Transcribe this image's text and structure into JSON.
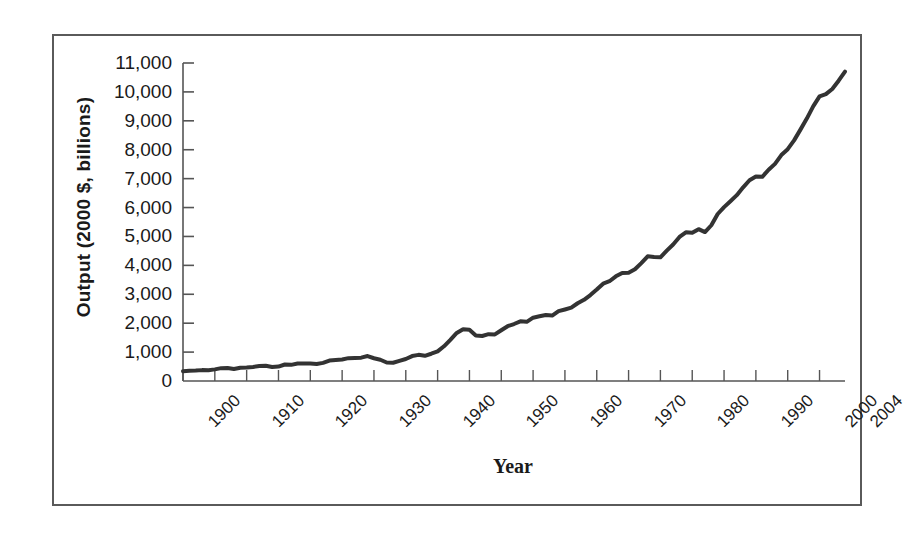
{
  "chart_data": {
    "type": "line",
    "title": "",
    "xlabel": "Year",
    "ylabel": "Output (2000 $, billions)",
    "xlim": [
      1900,
      2004
    ],
    "ylim": [
      0,
      11000
    ],
    "grid": false,
    "legend": "none",
    "line_color": "#333333",
    "line_width_px": 4,
    "y_tick_labels": [
      "11,000",
      "10,000",
      "9,000",
      "8,000",
      "7,000",
      "6,000",
      "5,000",
      "4,000",
      "3,000",
      "2,000",
      "1,000",
      "0"
    ],
    "y_tick_values": [
      11000,
      10000,
      9000,
      8000,
      7000,
      6000,
      5000,
      4000,
      3000,
      2000,
      1000,
      0
    ],
    "y_tick_interval": 1000,
    "x_tick_labels": [
      "1900",
      "1910",
      "1920",
      "1930",
      "1940",
      "1950",
      "1960",
      "1970",
      "1980",
      "1990",
      "2000",
      "2004"
    ],
    "x_tick_values": [
      1900,
      1910,
      1920,
      1930,
      1940,
      1950,
      1960,
      1970,
      1980,
      1990,
      2000,
      2004
    ],
    "x_minor_tick_interval": 5,
    "series": [
      {
        "name": "Real output",
        "x": [
          1900,
          1901,
          1902,
          1903,
          1904,
          1905,
          1906,
          1907,
          1908,
          1909,
          1910,
          1911,
          1912,
          1913,
          1914,
          1915,
          1916,
          1917,
          1918,
          1919,
          1920,
          1921,
          1922,
          1923,
          1924,
          1925,
          1926,
          1927,
          1928,
          1929,
          1930,
          1931,
          1932,
          1933,
          1934,
          1935,
          1936,
          1937,
          1938,
          1939,
          1940,
          1941,
          1942,
          1943,
          1944,
          1945,
          1946,
          1947,
          1948,
          1949,
          1950,
          1951,
          1952,
          1953,
          1954,
          1955,
          1956,
          1957,
          1958,
          1959,
          1960,
          1961,
          1962,
          1963,
          1964,
          1965,
          1966,
          1967,
          1968,
          1969,
          1970,
          1971,
          1972,
          1973,
          1974,
          1975,
          1976,
          1977,
          1978,
          1979,
          1980,
          1981,
          1982,
          1983,
          1984,
          1985,
          1986,
          1987,
          1988,
          1989,
          1990,
          1991,
          1992,
          1993,
          1994,
          1995,
          1996,
          1997,
          1998,
          1999,
          2000,
          2001,
          2002,
          2003,
          2004
        ],
        "values": [
          400,
          420,
          425,
          445,
          440,
          475,
          525,
          535,
          490,
          545,
          555,
          575,
          610,
          625,
          575,
          590,
          675,
          660,
          715,
          720,
          715,
          695,
          740,
          835,
          860,
          880,
          935,
          945,
          955,
          1020,
          930,
          870,
          755,
          745,
          825,
          900,
          1020,
          1070,
          1030,
          1115,
          1210,
          1420,
          1685,
          1965,
          2120,
          2095,
          1860,
          1840,
          1915,
          1905,
          2075,
          2240,
          2330,
          2440,
          2420,
          2590,
          2645,
          2700,
          2675,
          2855,
          2925,
          3000,
          3180,
          3320,
          3515,
          3740,
          3980,
          4080,
          4280,
          4420,
          4430,
          4570,
          4820,
          5100,
          5070,
          5060,
          5330,
          5580,
          5890,
          6080,
          6060,
          6210,
          6090,
          6370,
          6830,
          7110,
          7350,
          7600,
          7920,
          8210,
          8360,
          8350,
          8640,
          8880,
          9240,
          9480,
          9840,
          10280,
          10730,
          11230,
          11640,
          11730,
          11940,
          12280,
          12650
        ],
        "values_plotted_scale_note": "Curve drawn to axis max 11,000; terminal point ≈10,700"
      }
    ],
    "annotations": []
  },
  "axis": {
    "y_title": "Output (2000 $, billions)",
    "x_title": "Year"
  }
}
